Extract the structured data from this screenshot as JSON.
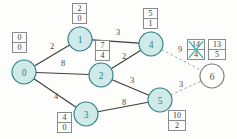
{
  "diagram": {
    "colors": {
      "node_fill": "#cfeae9",
      "node_stroke": "#2a7f82",
      "node_text": "#2a7f82",
      "unvisited_fill": "#fdfdfb",
      "unvisited_stroke": "#7a7a7a",
      "edge": "#3c3c3c",
      "dashed_edge": "#9a9a9a",
      "strike": "#3fb9ae",
      "box_border": "#8a8a8a"
    },
    "nodes": [
      {
        "id": "0",
        "label": "0",
        "x": 24,
        "y": 72,
        "r": 12,
        "state": "visited"
      },
      {
        "id": "1",
        "label": "1",
        "x": 80,
        "y": 39,
        "r": 12,
        "state": "visited"
      },
      {
        "id": "2",
        "label": "2",
        "x": 101,
        "y": 75,
        "r": 12,
        "state": "visited"
      },
      {
        "id": "3",
        "label": "3",
        "x": 86,
        "y": 114,
        "r": 12,
        "state": "visited"
      },
      {
        "id": "4",
        "label": "4",
        "x": 151,
        "y": 44,
        "r": 12,
        "state": "visited"
      },
      {
        "id": "5",
        "label": "5",
        "x": 160,
        "y": 100,
        "r": 12,
        "state": "visited"
      },
      {
        "id": "6",
        "label": "6",
        "x": 212,
        "y": 76,
        "r": 12,
        "state": "unvisited"
      }
    ],
    "edges": [
      {
        "from": "0",
        "to": "1",
        "weight": "2",
        "style": "solid",
        "wx": 52,
        "wy": 46
      },
      {
        "from": "0",
        "to": "2",
        "weight": "8",
        "style": "solid",
        "wx": 63,
        "wy": 63
      },
      {
        "from": "0",
        "to": "3",
        "weight": "4",
        "style": "solid",
        "wx": 56,
        "wy": 96
      },
      {
        "from": "1",
        "to": "4",
        "weight": "3",
        "style": "solid",
        "wx": 118,
        "wy": 32
      },
      {
        "from": "2",
        "to": "4",
        "weight": "2",
        "style": "solid",
        "wx": 124,
        "wy": 56
      },
      {
        "from": "2",
        "to": "5",
        "weight": "3",
        "style": "solid",
        "wx": 132,
        "wy": 80
      },
      {
        "from": "3",
        "to": "5",
        "weight": "8",
        "style": "solid",
        "wx": 124,
        "wy": 102
      },
      {
        "from": "4",
        "to": "6",
        "weight": "9",
        "style": "dashed",
        "wx": 180,
        "wy": 49
      },
      {
        "from": "5",
        "to": "6",
        "weight": "3",
        "style": "dashed",
        "wx": 181,
        "wy": 84
      }
    ],
    "labels": [
      {
        "for": "0",
        "dist": "0",
        "prev": "0",
        "x": 12,
        "y": 32,
        "wide": false,
        "crossed": false
      },
      {
        "for": "1",
        "dist": "2",
        "prev": "0",
        "x": 72,
        "y": 3,
        "wide": false,
        "crossed": false
      },
      {
        "for": "2",
        "dist": "7",
        "prev": "4",
        "x": 95,
        "y": 40,
        "wide": false,
        "crossed": false
      },
      {
        "for": "3",
        "dist": "4",
        "prev": "0",
        "x": 57,
        "y": 112,
        "wide": false,
        "crossed": false
      },
      {
        "for": "4",
        "dist": "5",
        "prev": "1",
        "x": 143,
        "y": 8,
        "wide": false,
        "crossed": false
      },
      {
        "for": "5",
        "dist": "10",
        "prev": "2",
        "x": 168,
        "y": 110,
        "wide": true,
        "crossed": false
      },
      {
        "for": "6",
        "dist": "14",
        "prev": "4",
        "x": 187,
        "y": 39,
        "wide": true,
        "crossed": true
      },
      {
        "for": "6",
        "dist": "13",
        "prev": "5",
        "x": 208,
        "y": 39,
        "wide": true,
        "crossed": false
      }
    ]
  }
}
